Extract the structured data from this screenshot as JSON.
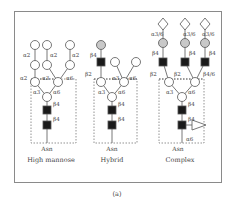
{
  "figure": {
    "caption": "(a)",
    "panels": [
      {
        "name": "High mannose",
        "asn_label": "Asn",
        "linkages": [
          "α2",
          "α2",
          "α2",
          "α2",
          "α3",
          "α6",
          "α3",
          "α6",
          "β4",
          "β4"
        ]
      },
      {
        "name": "Hybrid",
        "asn_label": "Asn",
        "linkages": [
          "β4",
          "β2",
          "α3",
          "α6",
          "α3",
          "α6",
          "β4",
          "β4"
        ]
      },
      {
        "name": "Complex",
        "asn_label": "Asn",
        "linkages": [
          "α3/6",
          "α3/6",
          "α3/6",
          "β4",
          "β4",
          "β4",
          "β2",
          "β2",
          "β4/6",
          "α3",
          "α6",
          "β4",
          "β4",
          "α6"
        ]
      }
    ],
    "legend_symbols": {
      "mannose": "white-circle",
      "galactose": "gray-circle",
      "glcnac": "black-square",
      "sialic_acid": "white-diamond",
      "fucose": "white-triangle"
    },
    "colors": {
      "stroke": "#555555",
      "galactose_fill": "#c8c8c8",
      "glcnac_fill": "#1a1a1a",
      "frame": "#8a8a8a"
    }
  }
}
